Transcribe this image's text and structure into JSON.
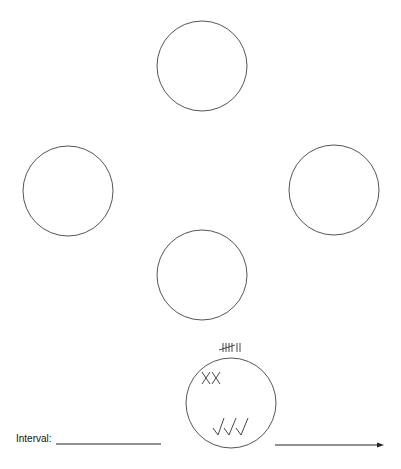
{
  "diagram": {
    "circles": [
      {
        "id": "top",
        "cx": 202,
        "cy": 66,
        "r": 45
      },
      {
        "id": "left",
        "cx": 68,
        "cy": 191,
        "r": 45
      },
      {
        "id": "right",
        "cx": 334,
        "cy": 190,
        "r": 45
      },
      {
        "id": "middle",
        "cx": 202,
        "cy": 275,
        "r": 45
      },
      {
        "id": "bottom",
        "cx": 231,
        "cy": 403,
        "r": 45
      }
    ],
    "bottom_circle": {
      "tally_marks": "̶̶IIII II",
      "tally_count": 7,
      "x_marks": "XX",
      "check_marks": "√√√"
    },
    "interval_label": "Interval:",
    "stroke_color": "#555555"
  }
}
